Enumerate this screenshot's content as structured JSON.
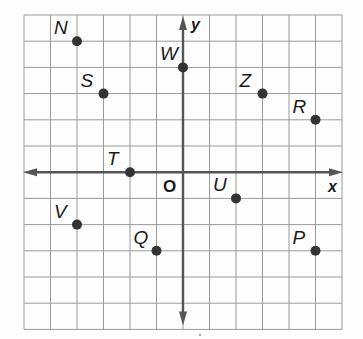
{
  "graph": {
    "type": "coordinate-plane",
    "x_range": [
      -6,
      6
    ],
    "y_range": [
      -6,
      6
    ],
    "x_axis_label": "x",
    "y_axis_label": "y",
    "origin_label": "O",
    "colors": {
      "grid": "#9a9a9a",
      "axis": "#555555",
      "point": "#333333",
      "label": "#1a1a1a",
      "background": "#fdfdfd"
    },
    "points": [
      {
        "name": "N",
        "x": -4,
        "y": 5,
        "label_pos": "upper-left"
      },
      {
        "name": "S",
        "x": -3,
        "y": 3,
        "label_pos": "upper-left"
      },
      {
        "name": "W",
        "x": 0,
        "y": 4,
        "label_pos": "upper-left"
      },
      {
        "name": "Z",
        "x": 3,
        "y": 3,
        "label_pos": "upper-left"
      },
      {
        "name": "R",
        "x": 5,
        "y": 2,
        "label_pos": "upper-left"
      },
      {
        "name": "T",
        "x": -2,
        "y": 0,
        "label_pos": "upper-left"
      },
      {
        "name": "U",
        "x": 2,
        "y": -1,
        "label_pos": "upper-left"
      },
      {
        "name": "V",
        "x": -4,
        "y": -2,
        "label_pos": "upper-left"
      },
      {
        "name": "Q",
        "x": -1,
        "y": -3,
        "label_pos": "upper-left"
      },
      {
        "name": "P",
        "x": 5,
        "y": -3,
        "label_pos": "upper-left"
      }
    ]
  }
}
